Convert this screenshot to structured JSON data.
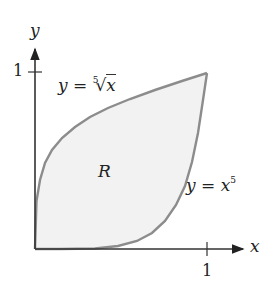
{
  "diagram": {
    "axes": {
      "x_label": "x",
      "y_label": "y",
      "x_tick": "1",
      "y_tick": "1"
    },
    "curves": [
      {
        "name": "fifth-root",
        "label_lhs": "y =",
        "label_index": "5",
        "label_radical": "√",
        "label_arg": "x"
      },
      {
        "name": "fifth-power",
        "label_lhs": "y =",
        "label_base": "x",
        "label_exp": "5"
      }
    ],
    "region_label": "R",
    "colors": {
      "axis": "#333333",
      "curve": "#8c8c8c",
      "fill": "#f2f2f2"
    }
  }
}
